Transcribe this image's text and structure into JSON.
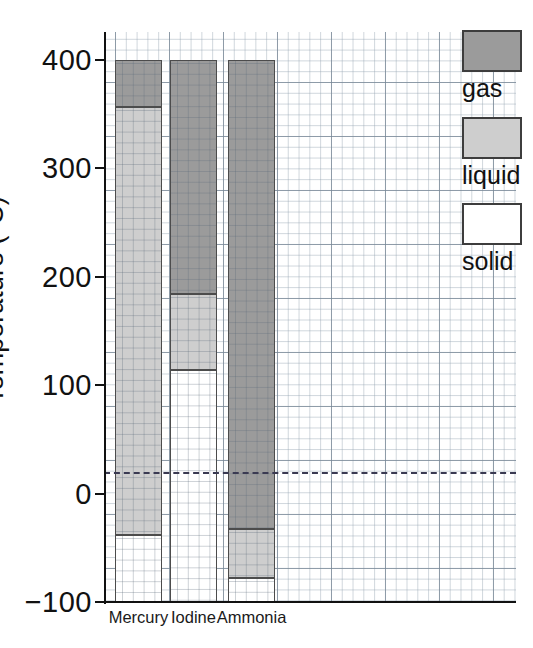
{
  "chart_data": {
    "type": "bar",
    "title": "",
    "xlabel": "",
    "ylabel": "Temperature (°C)",
    "ylim": [
      -100,
      400
    ],
    "yticks": [
      -100,
      0,
      100,
      200,
      300,
      400
    ],
    "ytick_labels": [
      "−100",
      "0",
      "100",
      "200",
      "300",
      "400"
    ],
    "grid": true,
    "grid_style": "graph-paper (minor 10 °C, major 50 °C)",
    "legend_position": "right",
    "legend": [
      {
        "key": "gas",
        "label": "gas",
        "color": "#9b9b9b"
      },
      {
        "key": "liquid",
        "label": "liquid",
        "color": "#cecece"
      },
      {
        "key": "solid",
        "label": "solid",
        "color": "#ffffff"
      }
    ],
    "annotations": [
      {
        "name": "room-temperature-line",
        "type": "hline",
        "value": 20,
        "style": "dashed",
        "color": "#3a3a52"
      }
    ],
    "categories": [
      "Mercury",
      "Iodine",
      "Ammonia"
    ],
    "series": [
      {
        "name": "Mercury",
        "melting_point": -38,
        "boiling_point": 357,
        "segments": [
          {
            "state": "solid",
            "from": -100,
            "to": -38
          },
          {
            "state": "liquid",
            "from": -38,
            "to": 357
          },
          {
            "state": "gas",
            "from": 357,
            "to": 400
          }
        ]
      },
      {
        "name": "Iodine",
        "melting_point": 114,
        "boiling_point": 184,
        "segments": [
          {
            "state": "solid",
            "from": -100,
            "to": 114
          },
          {
            "state": "liquid",
            "from": 114,
            "to": 184
          },
          {
            "state": "gas",
            "from": 184,
            "to": 400
          }
        ]
      },
      {
        "name": "Ammonia",
        "melting_point": -78,
        "boiling_point": -33,
        "segments": [
          {
            "state": "solid",
            "from": -100,
            "to": -78
          },
          {
            "state": "liquid",
            "from": -78,
            "to": -33
          },
          {
            "state": "gas",
            "from": -33,
            "to": 400
          }
        ]
      }
    ]
  },
  "axis": {
    "y_title": "Temperature (°C)"
  },
  "legend": {
    "items": [
      {
        "label": "gas"
      },
      {
        "label": "liquid"
      },
      {
        "label": "solid"
      }
    ]
  }
}
